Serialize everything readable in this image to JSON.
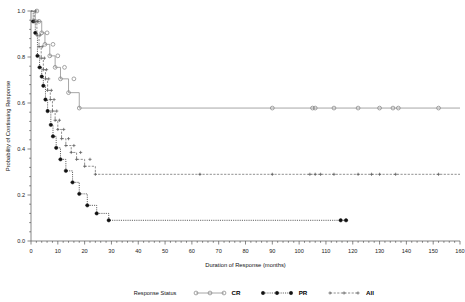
{
  "chart_data": {
    "type": "line",
    "plot_kind": "kaplan-meier",
    "title": "",
    "xlabel": "Duration of Response (months)",
    "ylabel": "Probability of Continuing Response",
    "xlim": [
      0,
      160
    ],
    "ylim": [
      0.0,
      1.0
    ],
    "xticks": [
      0,
      10,
      20,
      30,
      40,
      50,
      60,
      70,
      80,
      90,
      100,
      110,
      120,
      130,
      140,
      150,
      160
    ],
    "yticks": [
      0.0,
      0.2,
      0.4,
      0.6,
      0.8,
      1.0
    ],
    "xtick_labels": [
      "0",
      "10",
      "20",
      "30",
      "40",
      "50",
      "60",
      "70",
      "80",
      "90",
      "100",
      "110",
      "120",
      "130",
      "140",
      "150",
      "160"
    ],
    "ytick_labels": [
      "0.0",
      "0.2",
      "0.4",
      "0.6",
      "0.8",
      "1.0"
    ],
    "grid": false,
    "legend_position": "bottom",
    "legend_title": "Response Status",
    "series": [
      {
        "name": "CR",
        "marker": "open-circle",
        "linestyle": "solid",
        "color": "#8a8a8a",
        "plateau": 0.578,
        "steps": [
          [
            0.0,
            1.0
          ],
          [
            1.6,
            1.0
          ],
          [
            1.6,
            0.955
          ],
          [
            4.0,
            0.955
          ],
          [
            4.0,
            0.905
          ],
          [
            5.2,
            0.905
          ],
          [
            5.2,
            0.855
          ],
          [
            7.0,
            0.855
          ],
          [
            7.0,
            0.805
          ],
          [
            9.0,
            0.805
          ],
          [
            9.0,
            0.755
          ],
          [
            11.0,
            0.755
          ],
          [
            11.0,
            0.705
          ],
          [
            14.0,
            0.705
          ],
          [
            14.0,
            0.645
          ],
          [
            18.0,
            0.645
          ],
          [
            18.0,
            0.578
          ],
          [
            160.0,
            0.578
          ]
        ],
        "censor_points": [
          [
            2.2,
            1.0
          ],
          [
            3.0,
            0.955
          ],
          [
            6.0,
            0.905
          ],
          [
            8.2,
            0.855
          ],
          [
            10.0,
            0.805
          ],
          [
            12.5,
            0.755
          ],
          [
            16.0,
            0.705
          ],
          [
            90.0,
            0.578
          ],
          [
            105.0,
            0.578
          ],
          [
            106.0,
            0.578
          ],
          [
            113.0,
            0.578
          ],
          [
            122.0,
            0.578
          ],
          [
            130.0,
            0.578
          ],
          [
            135.0,
            0.578
          ],
          [
            137.0,
            0.578
          ],
          [
            152.0,
            0.578
          ]
        ]
      },
      {
        "name": "PR",
        "marker": "filled-circle",
        "linestyle": "dotted",
        "color": "#1c1c1c",
        "plateau": 0.09,
        "steps": [
          [
            0.0,
            1.0
          ],
          [
            0.8,
            1.0
          ],
          [
            0.8,
            0.955
          ],
          [
            1.6,
            0.955
          ],
          [
            1.6,
            0.905
          ],
          [
            2.4,
            0.905
          ],
          [
            2.4,
            0.805
          ],
          [
            3.2,
            0.805
          ],
          [
            3.2,
            0.755
          ],
          [
            4.0,
            0.755
          ],
          [
            4.0,
            0.715
          ],
          [
            4.6,
            0.715
          ],
          [
            4.6,
            0.675
          ],
          [
            5.4,
            0.675
          ],
          [
            5.4,
            0.615
          ],
          [
            6.2,
            0.615
          ],
          [
            6.2,
            0.565
          ],
          [
            7.4,
            0.565
          ],
          [
            7.4,
            0.505
          ],
          [
            8.2,
            0.505
          ],
          [
            8.2,
            0.455
          ],
          [
            9.4,
            0.455
          ],
          [
            9.4,
            0.405
          ],
          [
            11.0,
            0.405
          ],
          [
            11.0,
            0.355
          ],
          [
            13.0,
            0.355
          ],
          [
            13.0,
            0.305
          ],
          [
            15.5,
            0.305
          ],
          [
            15.5,
            0.255
          ],
          [
            18.0,
            0.255
          ],
          [
            18.0,
            0.205
          ],
          [
            21.0,
            0.205
          ],
          [
            21.0,
            0.155
          ],
          [
            24.5,
            0.155
          ],
          [
            24.5,
            0.12
          ],
          [
            29.0,
            0.12
          ],
          [
            29.0,
            0.09
          ],
          [
            117.0,
            0.09
          ]
        ],
        "censor_points": [
          [
            115.5,
            0.09
          ],
          [
            117.5,
            0.09
          ]
        ]
      },
      {
        "name": "All",
        "marker": "cross",
        "linestyle": "dashed",
        "color": "#6a6a6a",
        "plateau": 0.29,
        "steps": [
          [
            0.0,
            1.0
          ],
          [
            1.2,
            1.0
          ],
          [
            1.2,
            0.955
          ],
          [
            2.2,
            0.955
          ],
          [
            2.2,
            0.895
          ],
          [
            3.0,
            0.895
          ],
          [
            3.0,
            0.845
          ],
          [
            3.8,
            0.845
          ],
          [
            3.8,
            0.795
          ],
          [
            4.6,
            0.795
          ],
          [
            4.6,
            0.745
          ],
          [
            5.4,
            0.745
          ],
          [
            5.4,
            0.705
          ],
          [
            6.2,
            0.705
          ],
          [
            6.2,
            0.655
          ],
          [
            7.2,
            0.655
          ],
          [
            7.2,
            0.615
          ],
          [
            8.0,
            0.615
          ],
          [
            8.0,
            0.565
          ],
          [
            9.0,
            0.565
          ],
          [
            9.0,
            0.525
          ],
          [
            10.0,
            0.525
          ],
          [
            10.0,
            0.485
          ],
          [
            11.4,
            0.485
          ],
          [
            11.4,
            0.445
          ],
          [
            13.0,
            0.445
          ],
          [
            13.0,
            0.415
          ],
          [
            15.0,
            0.415
          ],
          [
            15.0,
            0.385
          ],
          [
            17.0,
            0.385
          ],
          [
            17.0,
            0.355
          ],
          [
            20.0,
            0.355
          ],
          [
            20.0,
            0.325
          ],
          [
            24.0,
            0.325
          ],
          [
            24.0,
            0.29
          ],
          [
            160.0,
            0.29
          ]
        ],
        "censor_points": [
          [
            1.8,
            1.0
          ],
          [
            2.6,
            0.955
          ],
          [
            3.4,
            0.895
          ],
          [
            4.2,
            0.845
          ],
          [
            5.0,
            0.795
          ],
          [
            5.8,
            0.745
          ],
          [
            6.6,
            0.705
          ],
          [
            7.6,
            0.655
          ],
          [
            8.6,
            0.615
          ],
          [
            9.6,
            0.565
          ],
          [
            10.6,
            0.525
          ],
          [
            12.2,
            0.485
          ],
          [
            14.0,
            0.445
          ],
          [
            16.0,
            0.415
          ],
          [
            18.5,
            0.385
          ],
          [
            22.0,
            0.355
          ],
          [
            63.0,
            0.29
          ],
          [
            90.0,
            0.29
          ],
          [
            104.0,
            0.29
          ],
          [
            106.0,
            0.29
          ],
          [
            108.0,
            0.29
          ],
          [
            113.0,
            0.29
          ],
          [
            122.0,
            0.29
          ],
          [
            127.0,
            0.29
          ],
          [
            130.0,
            0.29
          ],
          [
            136.0,
            0.29
          ],
          [
            152.0,
            0.29
          ]
        ]
      }
    ]
  },
  "legend": {
    "title": "Response Status",
    "entries": [
      {
        "label": "CR",
        "marker": "open-circle",
        "linestyle": "solid"
      },
      {
        "label": "PR",
        "marker": "filled-circle",
        "linestyle": "dotted"
      },
      {
        "label": "All",
        "marker": "cross",
        "linestyle": "dashed"
      }
    ]
  }
}
